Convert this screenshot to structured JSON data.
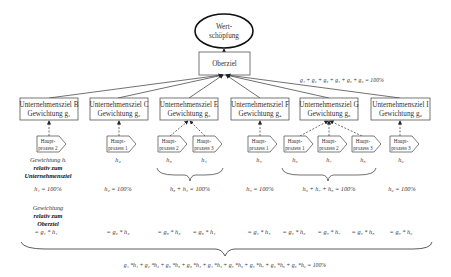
{
  "root": {
    "label_line1": "Wert-",
    "label_line2": "schöpfung"
  },
  "top_goal": {
    "label": "Oberziel"
  },
  "top_equation": "g₁ + g₂ + g₃ + g₄ + g₅ + g₆ = 100%",
  "goals": [
    {
      "title": "Unternehmensziel B",
      "weight": "Gewichtung g₁"
    },
    {
      "title": "Unternehmensziel C",
      "weight": "Gewichtung g₂"
    },
    {
      "title": "Unternehmensziel E",
      "weight": "Gewichtung g₃"
    },
    {
      "title": "Unternehmensziel F",
      "weight": "Gewichtung g₄"
    },
    {
      "title": "Unternehmensziel G",
      "weight": "Gewichtung g₅"
    },
    {
      "title": "Unternehmensziel I",
      "weight": "Gewichtung g₆"
    }
  ],
  "processes": [
    {
      "line1": "Haupt-",
      "line2": "prozess 2",
      "h": "h₁"
    },
    {
      "line1": "Haupt-",
      "line2": "prozess 1",
      "h": "h₂"
    },
    {
      "line1": "Haupt-",
      "line2": "prozess 2",
      "h": "h₃"
    },
    {
      "line1": "Haupt-",
      "line2": "prozess 3",
      "h": "h₄"
    },
    {
      "line1": "Haupt-",
      "line2": "prozess 1",
      "h": "h₅"
    },
    {
      "line1": "Haupt-",
      "line2": "prozess 1",
      "h": "h₆"
    },
    {
      "line1": "Haupt-",
      "line2": "prozess 2",
      "h": "h₇"
    },
    {
      "line1": "Haupt-",
      "line2": "prozess 3",
      "h": "h₈"
    },
    {
      "line1": "Haupt-",
      "line2": "prozess 3",
      "h": "h₉"
    }
  ],
  "labels": {
    "weight_relative_goal_line1": "Gewichtung hᵢ",
    "weight_relative_goal_line2": "relativ zum",
    "weight_relative_goal_line3": "Unternehmensziel",
    "weight_relative_top_line1": "Gewichtung",
    "weight_relative_top_line2": "relativ zum",
    "weight_relative_top_line3": "Oberziel"
  },
  "sums": [
    "h₁ = 100%",
    "h₂ = 100%",
    "h₃ + h₄ = 100%",
    "h₅ = 100%",
    "h₆ + h₇ + h₈ = 100%",
    "h₉ = 100%"
  ],
  "products": [
    "= g₁ * h₁",
    "= g₂ * h₂",
    "= g₃ * h₃",
    "= g₃ * h₄",
    "= g₄ * h₅",
    "= g₅ * h₆",
    "= g₅ * h₇",
    "= g₅ * h₈",
    "= g₆ * h₉"
  ],
  "final_equation": "g₁ *h₁ + g₂ *h₂ + g₃ *h₃ + g₃ *h₄ + g₄ *h₅ + g₅ *h₆ + g₅ *h₇ + g₅ *h₈ + g₆ *h₉ = 100%"
}
